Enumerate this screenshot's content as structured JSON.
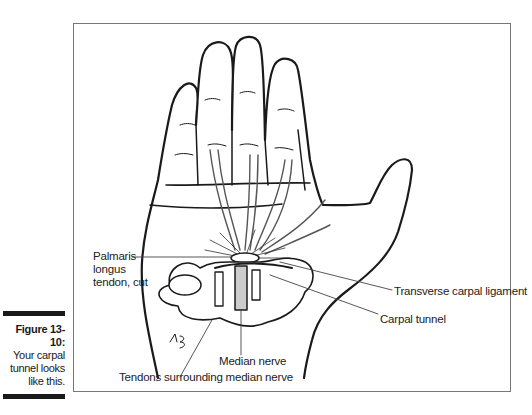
{
  "caption": {
    "title": "Figure 13-10:",
    "lines": [
      "Your carpal",
      "tunnel looks",
      "like this."
    ]
  },
  "figure": {
    "signature": "KB",
    "labels": {
      "palmaris": [
        "Palmaris",
        "longus",
        "tendon, cut"
      ],
      "transverse_ligament": "Transverse carpal ligament",
      "carpal_tunnel": "Carpal tunnel",
      "median_nerve": "Median nerve",
      "tendons": "Tendons surrounding median nerve"
    }
  }
}
